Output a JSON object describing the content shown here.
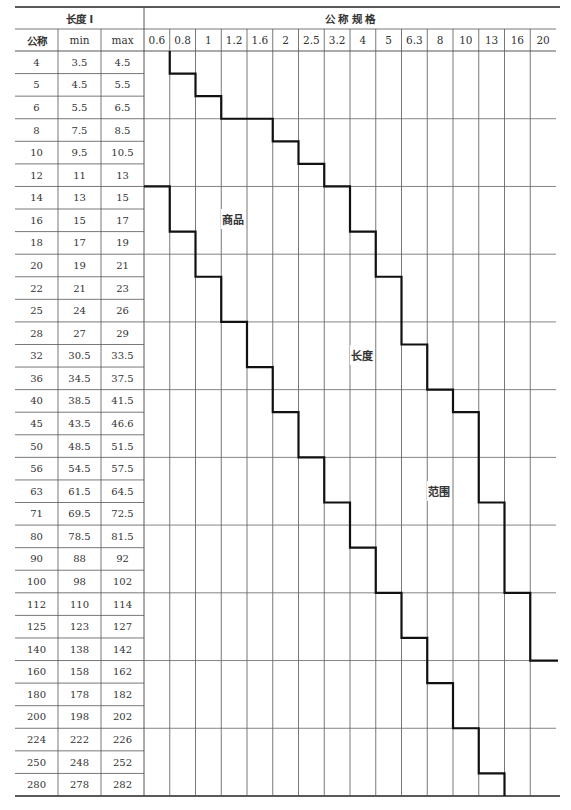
{
  "table": {
    "length_header": "长度 l",
    "spec_header": "公 称 规 格",
    "sub_headers": {
      "nominal": "公称",
      "min": "min",
      "max": "max"
    },
    "spec_columns": [
      "0.6",
      "0.8",
      "1",
      "1.2",
      "1.6",
      "2",
      "2.5",
      "3.2",
      "4",
      "5",
      "6.3",
      "8",
      "10",
      "13",
      "16",
      "20"
    ],
    "rows": [
      {
        "nominal": "4",
        "min": "3.5",
        "max": "4.5"
      },
      {
        "nominal": "5",
        "min": "4.5",
        "max": "5.5"
      },
      {
        "nominal": "6",
        "min": "5.5",
        "max": "6.5"
      },
      {
        "nominal": "8",
        "min": "7.5",
        "max": "8.5"
      },
      {
        "nominal": "10",
        "min": "9.5",
        "max": "10.5"
      },
      {
        "nominal": "12",
        "min": "11",
        "max": "13"
      },
      {
        "nominal": "14",
        "min": "13",
        "max": "15"
      },
      {
        "nominal": "16",
        "min": "15",
        "max": "17"
      },
      {
        "nominal": "18",
        "min": "17",
        "max": "19"
      },
      {
        "nominal": "20",
        "min": "19",
        "max": "21"
      },
      {
        "nominal": "22",
        "min": "21",
        "max": "23"
      },
      {
        "nominal": "25",
        "min": "24",
        "max": "26"
      },
      {
        "nominal": "28",
        "min": "27",
        "max": "29"
      },
      {
        "nominal": "32",
        "min": "30.5",
        "max": "33.5"
      },
      {
        "nominal": "36",
        "min": "34.5",
        "max": "37.5"
      },
      {
        "nominal": "40",
        "min": "38.5",
        "max": "41.5"
      },
      {
        "nominal": "45",
        "min": "43.5",
        "max": "46.6"
      },
      {
        "nominal": "50",
        "min": "48.5",
        "max": "51.5"
      },
      {
        "nominal": "56",
        "min": "54.5",
        "max": "57.5"
      },
      {
        "nominal": "63",
        "min": "61.5",
        "max": "64.5"
      },
      {
        "nominal": "71",
        "min": "69.5",
        "max": "72.5"
      },
      {
        "nominal": "80",
        "min": "78.5",
        "max": "81.5"
      },
      {
        "nominal": "90",
        "min": "88",
        "max": "92"
      },
      {
        "nominal": "100",
        "min": "98",
        "max": "102"
      },
      {
        "nominal": "112",
        "min": "110",
        "max": "114"
      },
      {
        "nominal": "125",
        "min": "123",
        "max": "127"
      },
      {
        "nominal": "140",
        "min": "138",
        "max": "142"
      },
      {
        "nominal": "160",
        "min": "158",
        "max": "162"
      },
      {
        "nominal": "180",
        "min": "178",
        "max": "182"
      },
      {
        "nominal": "200",
        "min": "198",
        "max": "202"
      },
      {
        "nominal": "224",
        "min": "222",
        "max": "226"
      },
      {
        "nominal": "250",
        "min": "248",
        "max": "252"
      },
      {
        "nominal": "280",
        "min": "278",
        "max": "282"
      }
    ],
    "region_labels": [
      "商品",
      "长度",
      "范围"
    ],
    "upper_boundary_steps": [
      [
        1,
        0
      ],
      [
        2,
        1
      ],
      [
        3,
        2
      ],
      [
        5,
        3
      ],
      [
        6,
        4
      ],
      [
        7,
        5
      ],
      [
        8,
        6
      ],
      [
        9,
        8
      ],
      [
        10,
        10
      ],
      [
        11,
        13
      ],
      [
        12,
        15
      ],
      [
        13,
        16
      ],
      [
        14,
        20
      ],
      [
        15,
        24
      ],
      [
        16,
        27
      ]
    ],
    "lower_boundary_steps": [
      [
        0,
        6
      ],
      [
        1,
        8
      ],
      [
        2,
        10
      ],
      [
        3,
        12
      ],
      [
        4,
        14
      ],
      [
        5,
        16
      ],
      [
        6,
        18
      ],
      [
        7,
        20
      ],
      [
        8,
        22
      ],
      [
        9,
        24
      ],
      [
        10,
        26
      ],
      [
        11,
        28
      ],
      [
        12,
        30
      ],
      [
        13,
        31
      ],
      [
        14,
        32
      ]
    ]
  }
}
